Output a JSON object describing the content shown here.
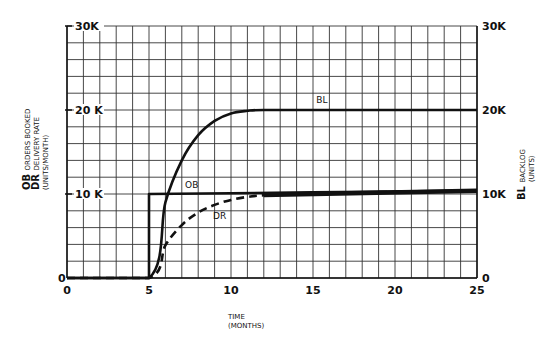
{
  "chart_data": {
    "type": "line",
    "title": "",
    "xlabel": "TIME (MONTHS)",
    "xlabel_lines": [
      "TIME",
      "(MONTHS)"
    ],
    "ylabel_left": {
      "lines": [
        {
          "abbr": "OB",
          "text": "ORDERS BOOKED"
        },
        {
          "abbr": "DR",
          "text": "DELIVERY RATE"
        },
        {
          "abbr": "",
          "text": "(UNITS/MONTH)"
        }
      ]
    },
    "ylabel_right": {
      "lines": [
        {
          "abbr": "BL",
          "text": "BACKLOG"
        },
        {
          "abbr": "",
          "text": "(UNITS)"
        }
      ]
    },
    "xlim": [
      0,
      25
    ],
    "ylim": [
      0,
      30000
    ],
    "x_ticks": [
      0,
      5,
      10,
      15,
      20,
      25
    ],
    "x_tick_labels": [
      "0",
      "5",
      "10",
      "15",
      "20",
      "25"
    ],
    "y_ticks_left": [
      0,
      10000,
      20000,
      30000
    ],
    "y_tick_labels_left": [
      "0",
      "10 K",
      "20 K",
      "30K"
    ],
    "y_ticks_right": [
      0,
      10000,
      20000,
      30000
    ],
    "y_tick_labels_right": [
      "0",
      "10K",
      "20K",
      "30K"
    ],
    "grid": true,
    "grid_x_step": 1,
    "grid_y_step": 2000,
    "legend": "inline labels",
    "series": [
      {
        "name": "OB",
        "style": "solid",
        "x": [
          0,
          5,
          5,
          10,
          15,
          20,
          25
        ],
        "values": [
          0,
          0,
          10000,
          10100,
          10200,
          10300,
          10400
        ]
      },
      {
        "name": "DR",
        "style": "dashed",
        "x": [
          0,
          5,
          6,
          7,
          8,
          9,
          10,
          11,
          12,
          15,
          20,
          25
        ],
        "values": [
          0,
          0,
          3900,
          6300,
          7800,
          8700,
          9300,
          9650,
          9850,
          10100,
          10250,
          10400
        ]
      },
      {
        "name": "BL",
        "style": "solid",
        "x": [
          0,
          5,
          6,
          7,
          8,
          9,
          10,
          11,
          12,
          15,
          20,
          25
        ],
        "values": [
          0,
          0,
          9000,
          14000,
          17000,
          18700,
          19600,
          19900,
          20000,
          20000,
          20000,
          20000
        ]
      }
    ]
  }
}
